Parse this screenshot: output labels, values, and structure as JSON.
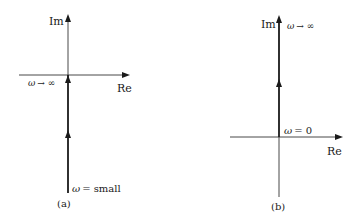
{
  "figure": {
    "panels": [
      {
        "id": "a",
        "caption": "(a)",
        "axes": {
          "imaginary_label": "Im",
          "real_label": "Re"
        },
        "locus": {
          "description": "Vertical line along imaginary axis from negative values up to the origin",
          "start_label_symbol": "ω",
          "start_label_text": "= small",
          "end_label_symbol": "ω",
          "end_label_text": "→ ∞"
        }
      },
      {
        "id": "b",
        "caption": "(b)",
        "axes": {
          "imaginary_label": "Im",
          "real_label": "Re"
        },
        "locus": {
          "description": "Vertical line along positive imaginary axis from origin upward",
          "start_label_symbol": "ω",
          "start_label_text": "= 0",
          "end_label_symbol": "ω",
          "end_label_text": "→ ∞"
        }
      }
    ],
    "colors": {
      "axis": "#333333",
      "locus": "#1a1a1a",
      "text": "#1a1a1a"
    }
  }
}
